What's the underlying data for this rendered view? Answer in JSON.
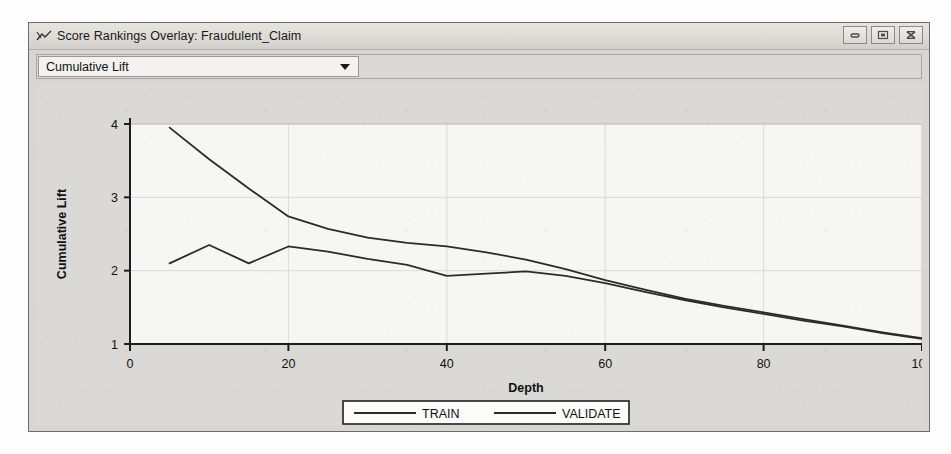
{
  "window": {
    "title": "Score Rankings Overlay: Fraudulent_Claim",
    "title_icon": "line-chart-icon",
    "buttons": {
      "minimize": "minimize-icon",
      "maximize": "maximize-icon",
      "close": "close-icon"
    }
  },
  "toolbar": {
    "measure_select": {
      "value": "Cumulative Lift",
      "arrow_icon": "chevron-down-icon"
    }
  },
  "chart_data": {
    "type": "line",
    "title": "",
    "xlabel": "Depth",
    "ylabel": "Cumulative Lift",
    "xlim": [
      0,
      100
    ],
    "ylim": [
      1,
      4
    ],
    "xticks": [
      0,
      20,
      40,
      60,
      80,
      100
    ],
    "yticks": [
      1,
      2,
      3,
      4
    ],
    "xtick_labels": [
      "0",
      "20",
      "40",
      "60",
      "80",
      "100"
    ],
    "ytick_labels": [
      "1",
      "2",
      "3",
      "4"
    ],
    "grid": true,
    "legend_position": "bottom",
    "x": [
      5,
      10,
      15,
      20,
      25,
      30,
      35,
      40,
      45,
      50,
      55,
      60,
      65,
      70,
      75,
      80,
      85,
      90,
      95,
      100
    ],
    "series": [
      {
        "name": "TRAIN",
        "color": "#2b2b2b",
        "values": [
          3.95,
          3.52,
          3.12,
          2.74,
          2.57,
          2.45,
          2.38,
          2.33,
          2.25,
          2.15,
          2.02,
          1.87,
          1.74,
          1.62,
          1.52,
          1.43,
          1.34,
          1.25,
          1.16,
          1.08
        ]
      },
      {
        "name": "VALIDATE",
        "color": "#2b2b2b",
        "values": [
          2.1,
          2.35,
          2.1,
          2.33,
          2.26,
          2.16,
          2.08,
          1.93,
          1.96,
          1.99,
          1.93,
          1.83,
          1.71,
          1.6,
          1.5,
          1.41,
          1.32,
          1.24,
          1.15,
          1.07
        ]
      }
    ]
  },
  "legend": {
    "items": [
      {
        "label": "TRAIN"
      },
      {
        "label": "VALIDATE"
      }
    ]
  }
}
